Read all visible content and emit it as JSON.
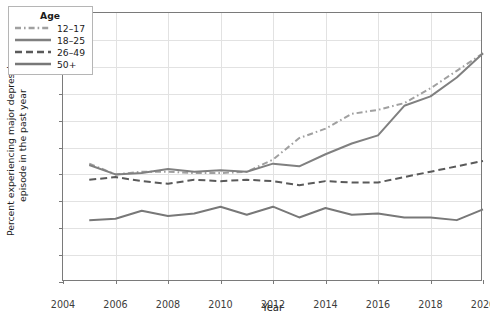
{
  "chart_data": {
    "type": "line",
    "title": "",
    "xlabel": "Year",
    "ylabel_line1": "Percent experiencing major depressive",
    "ylabel_line2": "episode in the past year",
    "xlim": [
      2004,
      2020
    ],
    "ylim": [
      0,
      20
    ],
    "x_ticks": [
      2004,
      2006,
      2008,
      2010,
      2012,
      2014,
      2016,
      2018,
      2020
    ],
    "y_ticks": [
      0,
      2,
      4,
      6,
      8,
      10,
      12,
      14,
      16,
      18,
      20
    ],
    "grid": true,
    "legend_position": "top-left",
    "legend_title": "Age",
    "x": [
      2005,
      2006,
      2007,
      2008,
      2009,
      2010,
      2011,
      2012,
      2013,
      2014,
      2015,
      2016,
      2017,
      2018,
      2019,
      2020
    ],
    "series": [
      {
        "name": "12–17",
        "style": "dashdot",
        "color": "#a0a0a0",
        "values": [
          8.8,
          8.0,
          8.2,
          8.2,
          8.1,
          8.1,
          8.2,
          9.1,
          10.7,
          11.4,
          12.5,
          12.8,
          13.3,
          14.4,
          15.7,
          17.0
        ]
      },
      {
        "name": "18–25",
        "style": "solid",
        "color": "#808080",
        "values": [
          8.7,
          8.0,
          8.1,
          8.4,
          8.2,
          8.3,
          8.2,
          8.8,
          8.6,
          9.5,
          10.3,
          10.9,
          13.1,
          13.8,
          15.2,
          17.0
        ]
      },
      {
        "name": "26–49",
        "style": "dashed",
        "color": "#5a5a5a",
        "values": [
          7.6,
          7.8,
          7.5,
          7.3,
          7.6,
          7.5,
          7.6,
          7.5,
          7.2,
          7.5,
          7.4,
          7.4,
          7.8,
          8.2,
          8.6,
          9.0
        ]
      },
      {
        "name": "50+",
        "style": "solid",
        "color": "#787878",
        "values": [
          4.6,
          4.7,
          5.3,
          4.9,
          5.1,
          5.6,
          5.0,
          5.6,
          4.8,
          5.5,
          5.0,
          5.1,
          4.8,
          4.8,
          4.6,
          5.4
        ]
      }
    ]
  }
}
